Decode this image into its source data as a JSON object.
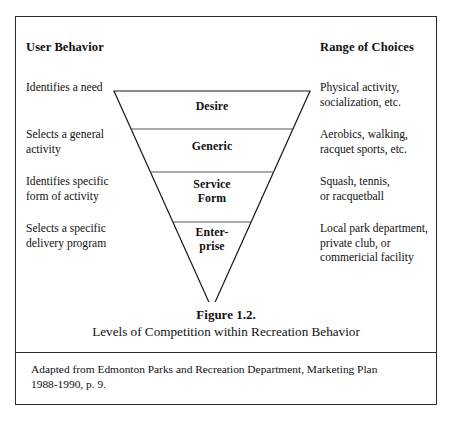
{
  "figure": {
    "columns": {
      "left_heading": "User Behavior",
      "right_heading": "Range of Choices"
    },
    "rows": [
      {
        "tier": "Desire",
        "user_behavior": [
          "Identifies a need"
        ],
        "range_of_choices": [
          "Physical activity,",
          "socialization, etc."
        ]
      },
      {
        "tier": "Generic",
        "user_behavior": [
          "Selects a general",
          "activity"
        ],
        "range_of_choices": [
          "Aerobics, walking,",
          "racquet sports, etc."
        ]
      },
      {
        "tier": "Service Form",
        "tier_line_1": "Service",
        "tier_line_2": "Form",
        "user_behavior": [
          "Identifies specific",
          "form of activity"
        ],
        "range_of_choices": [
          "Squash, tennis,",
          "or racquetball"
        ]
      },
      {
        "tier": "Enterprise",
        "tier_line_1": "Enter-",
        "tier_line_2": "prise",
        "user_behavior": [
          "Selects a specific",
          "delivery program"
        ],
        "range_of_choices": [
          "Local park department,",
          "private club, or",
          "commericial facility"
        ]
      }
    ],
    "tier_labels": {
      "desire": "Desire",
      "generic": "Generic",
      "service_form_line1": "Service",
      "service_form_line2": "Form",
      "enterprise_line1": "Enter-",
      "enterprise_line2": "prise"
    },
    "caption": {
      "title": "Figure 1.2.",
      "subtitle": "Levels of Competition within Recreation Behavior"
    },
    "source_note": {
      "line1": "Adapted from Edmonton Parks and Recreation Department, Marketing Plan",
      "line2": "1988-1990, p. 9."
    },
    "colors": {
      "frame": "#2a2a2a",
      "pyramid_outline": "#1a1a1a",
      "tier_divider": "#55565a",
      "text": "#111111",
      "background": "#ffffff"
    }
  }
}
